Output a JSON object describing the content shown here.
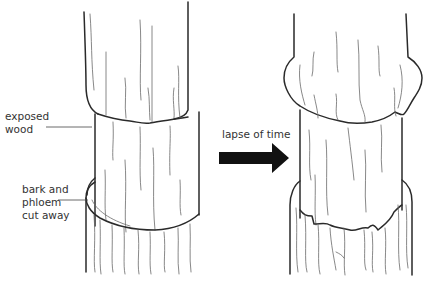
{
  "labels": {
    "exposed_wood": [
      "exposed",
      "wood"
    ],
    "bark_cut": [
      "bark and",
      "phloem",
      "cut away"
    ],
    "arrow_caption": "lapse of time"
  },
  "colors": {
    "outline": "#2a2a2a",
    "grain": "#6a6a6a",
    "arrow": "#111111",
    "text": "#333333"
  },
  "panels": [
    {
      "name": "before",
      "description": "stem with ring of bark and phloem removed"
    },
    {
      "name": "after",
      "description": "stem after lapse of time with swelling above cut"
    }
  ]
}
